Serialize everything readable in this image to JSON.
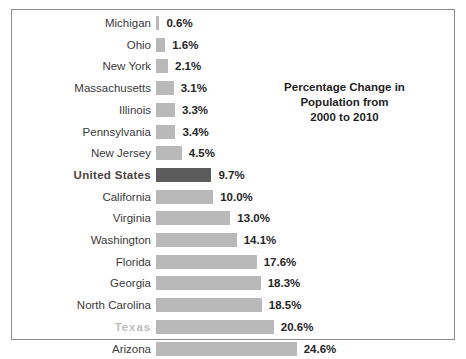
{
  "chart_data": {
    "type": "bar",
    "orientation": "horizontal",
    "title": "Percentage Change in Population from 2000 to 2010",
    "title_lines": [
      "Percentage Change in",
      "Population from",
      "2000 to 2010"
    ],
    "xlabel": "",
    "ylabel": "",
    "xlim": [
      0,
      24.6
    ],
    "grid": false,
    "legend": "none",
    "value_suffix": "%",
    "categories": [
      "Michigan",
      "Ohio",
      "New York",
      "Massachusetts",
      "Illinois",
      "Pennsylvania",
      "New Jersey",
      "United States",
      "California",
      "Virginia",
      "Washington",
      "Florida",
      "Georgia",
      "North Carolina",
      "Texas",
      "Arizona"
    ],
    "values": [
      0.6,
      1.6,
      2.1,
      3.1,
      3.3,
      3.4,
      4.5,
      9.7,
      10.0,
      13.0,
      14.1,
      17.6,
      18.3,
      18.5,
      20.6,
      24.6
    ],
    "value_labels": [
      "0.6%",
      "1.6%",
      "2.1%",
      "3.1%",
      "3.3%",
      "3.4%",
      "4.5%",
      "9.7%",
      "10.0%",
      "13.0%",
      "14.1%",
      "17.6%",
      "18.3%",
      "18.5%",
      "20.6%",
      "24.6%"
    ],
    "rows": [
      {
        "label": "Michigan",
        "value": 0.6,
        "value_label": "0.6%",
        "style": "normal"
      },
      {
        "label": "Ohio",
        "value": 1.6,
        "value_label": "1.6%",
        "style": "normal"
      },
      {
        "label": "New York",
        "value": 2.1,
        "value_label": "2.1%",
        "style": "normal"
      },
      {
        "label": "Massachusetts",
        "value": 3.1,
        "value_label": "3.1%",
        "style": "normal"
      },
      {
        "label": "Illinois",
        "value": 3.3,
        "value_label": "3.3%",
        "style": "normal"
      },
      {
        "label": "Pennsylvania",
        "value": 3.4,
        "value_label": "3.4%",
        "style": "normal"
      },
      {
        "label": "New Jersey",
        "value": 4.5,
        "value_label": "4.5%",
        "style": "normal"
      },
      {
        "label": "United States",
        "value": 9.7,
        "value_label": "9.7%",
        "style": "highlight"
      },
      {
        "label": "California",
        "value": 10.0,
        "value_label": "10.0%",
        "style": "normal"
      },
      {
        "label": "Virginia",
        "value": 13.0,
        "value_label": "13.0%",
        "style": "normal"
      },
      {
        "label": "Washington",
        "value": 14.1,
        "value_label": "14.1%",
        "style": "normal"
      },
      {
        "label": "Florida",
        "value": 17.6,
        "value_label": "17.6%",
        "style": "normal"
      },
      {
        "label": "Georgia",
        "value": 18.3,
        "value_label": "18.3%",
        "style": "normal"
      },
      {
        "label": "North Carolina",
        "value": 18.5,
        "value_label": "18.5%",
        "style": "normal"
      },
      {
        "label": "Texas",
        "value": 20.6,
        "value_label": "20.6%",
        "style": "muted"
      },
      {
        "label": "Arizona",
        "value": 24.6,
        "value_label": "24.6%",
        "style": "normal"
      }
    ],
    "colors": {
      "bar_default": "#b9b9b9",
      "bar_highlight": "#5c5c5c",
      "label_default": "#3b3b3b",
      "label_highlight": "#4a4340",
      "label_muted": "#c0bdbb",
      "value_text": "#262626",
      "border": "#8c8c8c",
      "background": "#ffffff"
    }
  }
}
